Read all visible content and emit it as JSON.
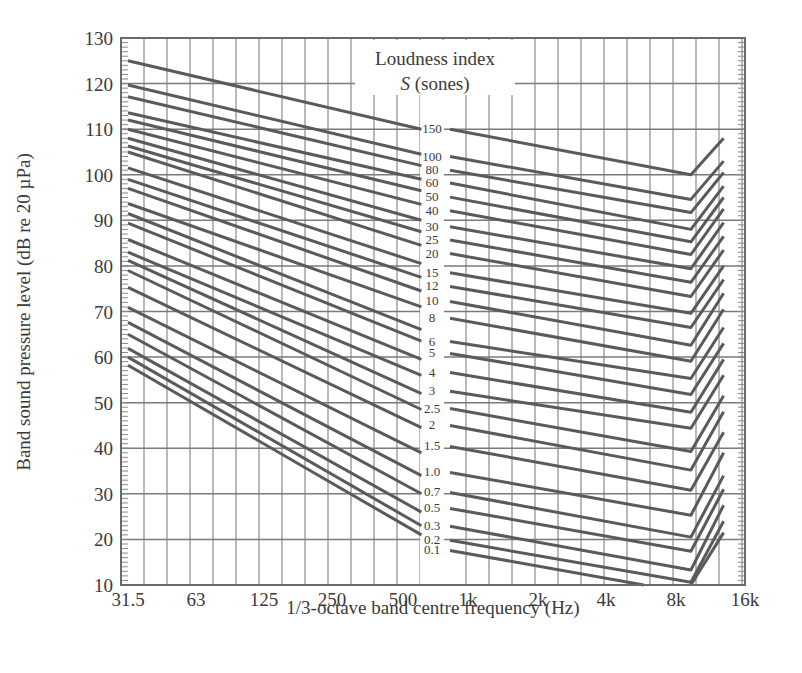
{
  "chart_data": {
    "type": "line",
    "title": "",
    "xlabel": "1/3-octave band centre frequency (Hz)",
    "ylabel": "Band sound pressure level (dB re 20 µPa)",
    "ylim": [
      10,
      130
    ],
    "yticks": [
      10,
      20,
      30,
      40,
      50,
      60,
      70,
      80,
      90,
      100,
      110,
      120,
      130
    ],
    "xticks": [
      "31.5",
      "63",
      "125",
      "250",
      "500",
      "1k",
      "2k",
      "4k",
      "8k",
      "16k"
    ],
    "x_scale": "log (1/3-octave bands)",
    "grid": true,
    "legend_title_line1": "Loudness index",
    "legend_title_line2_italic": "S",
    "legend_title_line2_rest": " (sones)",
    "annotation": "Equal-loudness-index contours; labels placed in a gap column between 500 Hz and 1 kHz",
    "series_points_description": "Each contour: [f_Hz, dB] points; left segment 31.5 Hz to ~600 Hz, right segment ~800 Hz to ~9 kHz kink then rising to 12.5 kHz",
    "series": [
      {
        "name": "150",
        "left": [
          [
            31.5,
            125
          ],
          [
            600,
            110
          ]
        ],
        "right": [
          [
            800,
            110
          ],
          [
            9000,
            100
          ],
          [
            12500,
            108
          ]
        ]
      },
      {
        "name": "100",
        "left": [
          [
            31.5,
            119.7
          ],
          [
            600,
            104.5
          ]
        ],
        "right": [
          [
            800,
            104
          ],
          [
            9000,
            94.6
          ],
          [
            12500,
            103
          ]
        ]
      },
      {
        "name": "80",
        "left": [
          [
            31.5,
            117.1
          ],
          [
            600,
            102
          ]
        ],
        "right": [
          [
            800,
            101
          ],
          [
            9000,
            91.7
          ],
          [
            12500,
            100.5
          ]
        ]
      },
      {
        "name": "60",
        "left": [
          [
            31.5,
            113.6
          ],
          [
            600,
            99
          ]
        ],
        "right": [
          [
            800,
            98.2
          ],
          [
            9000,
            88
          ],
          [
            12500,
            97.5
          ]
        ]
      },
      {
        "name": "50",
        "left": [
          [
            31.5,
            112
          ],
          [
            600,
            96.5
          ]
        ],
        "right": [
          [
            800,
            95.1
          ],
          [
            9000,
            85.3
          ],
          [
            12500,
            95
          ]
        ]
      },
      {
        "name": "40",
        "left": [
          [
            31.5,
            110
          ],
          [
            600,
            93.5
          ]
        ],
        "right": [
          [
            800,
            92.1
          ],
          [
            9000,
            82.5
          ],
          [
            12500,
            92.5
          ]
        ]
      },
      {
        "name": "30",
        "left": [
          [
            31.5,
            108
          ],
          [
            600,
            90
          ]
        ],
        "right": [
          [
            800,
            88.6
          ],
          [
            9000,
            79.4
          ],
          [
            12500,
            89.5
          ]
        ]
      },
      {
        "name": "25",
        "left": [
          [
            31.5,
            106.3
          ],
          [
            600,
            87.5
          ]
        ],
        "right": [
          [
            800,
            85.7
          ],
          [
            9000,
            76.4
          ],
          [
            12500,
            86.5
          ]
        ]
      },
      {
        "name": "20",
        "left": [
          [
            31.5,
            105
          ],
          [
            600,
            84.5
          ]
        ],
        "right": [
          [
            800,
            82.7
          ],
          [
            9000,
            73.3
          ],
          [
            12500,
            83.5
          ]
        ]
      },
      {
        "name": "15",
        "left": [
          [
            31.5,
            101.5
          ],
          [
            600,
            80.5
          ]
        ],
        "right": [
          [
            800,
            78.5
          ],
          [
            9000,
            69.6
          ],
          [
            12500,
            80
          ]
        ]
      },
      {
        "name": "12",
        "left": [
          [
            31.5,
            99
          ],
          [
            600,
            77.5
          ]
        ],
        "right": [
          [
            800,
            75.5
          ],
          [
            9000,
            66.5
          ],
          [
            12500,
            77
          ]
        ]
      },
      {
        "name": "10",
        "left": [
          [
            31.5,
            97
          ],
          [
            600,
            74.5
          ]
        ],
        "right": [
          [
            800,
            72.2
          ],
          [
            9000,
            62.6
          ],
          [
            12500,
            74
          ]
        ]
      },
      {
        "name": "8",
        "left": [
          [
            31.5,
            93.7
          ],
          [
            600,
            71
          ]
        ],
        "right": [
          [
            800,
            68.5
          ],
          [
            9000,
            59.1
          ],
          [
            12500,
            70.5
          ]
        ]
      },
      {
        "name": "6",
        "left": [
          [
            31.5,
            91.5
          ],
          [
            600,
            66
          ]
        ],
        "right": [
          [
            800,
            63.4
          ],
          [
            9000,
            55.3
          ],
          [
            12500,
            66.5
          ]
        ]
      },
      {
        "name": "5",
        "left": [
          [
            31.5,
            89.4
          ],
          [
            600,
            63.5
          ]
        ],
        "right": [
          [
            800,
            60.8
          ],
          [
            9000,
            51.8
          ],
          [
            12500,
            63
          ]
        ]
      },
      {
        "name": "4",
        "left": [
          [
            31.5,
            85.8
          ],
          [
            600,
            59.5
          ]
        ],
        "right": [
          [
            800,
            56.6
          ],
          [
            9000,
            47.9
          ],
          [
            12500,
            59.5
          ]
        ]
      },
      {
        "name": "3",
        "left": [
          [
            31.5,
            83
          ],
          [
            600,
            56
          ]
        ],
        "right": [
          [
            800,
            52.5
          ],
          [
            9000,
            44.4
          ],
          [
            12500,
            56
          ]
        ]
      },
      {
        "name": "2.5",
        "left": [
          [
            31.5,
            81.2
          ],
          [
            600,
            52
          ]
        ],
        "right": [
          [
            800,
            48.7
          ],
          [
            9000,
            39.3
          ],
          [
            12500,
            51.5
          ]
        ]
      },
      {
        "name": "2",
        "left": [
          [
            31.5,
            79
          ],
          [
            600,
            48.5
          ]
        ],
        "right": [
          [
            800,
            45
          ],
          [
            9000,
            35.2
          ],
          [
            12500,
            48
          ]
        ]
      },
      {
        "name": "1.5",
        "left": [
          [
            31.5,
            75.3
          ],
          [
            600,
            44.5
          ]
        ],
        "right": [
          [
            800,
            40.4
          ],
          [
            9000,
            30.8
          ],
          [
            12500,
            43.5
          ]
        ]
      },
      {
        "name": "1.0",
        "left": [
          [
            31.5,
            70.9
          ],
          [
            600,
            39
          ]
        ],
        "right": [
          [
            800,
            34.7
          ],
          [
            9000,
            25.3
          ],
          [
            12500,
            39
          ]
        ]
      },
      {
        "name": "0.7",
        "left": [
          [
            31.5,
            67.6
          ],
          [
            600,
            34
          ]
        ],
        "right": [
          [
            800,
            30.3
          ],
          [
            9000,
            20.5
          ],
          [
            12500,
            34
          ]
        ]
      },
      {
        "name": "0.5",
        "left": [
          [
            31.5,
            65
          ],
          [
            600,
            30
          ]
        ],
        "right": [
          [
            800,
            26.8
          ],
          [
            9000,
            17.4
          ],
          [
            12500,
            31
          ]
        ]
      },
      {
        "name": "0.3",
        "left": [
          [
            31.5,
            61.9
          ],
          [
            600,
            26
          ]
        ],
        "right": [
          [
            800,
            22.9
          ],
          [
            9000,
            13.3
          ],
          [
            12500,
            27.5
          ]
        ]
      },
      {
        "name": "0.2",
        "left": [
          [
            31.5,
            60
          ],
          [
            600,
            23
          ]
        ],
        "right": [
          [
            800,
            19.8
          ],
          [
            9000,
            10.6
          ],
          [
            12500,
            24
          ]
        ]
      },
      {
        "name": "0.1",
        "left": [
          [
            31.5,
            58.2
          ],
          [
            600,
            21
          ]
        ],
        "right": [
          [
            800,
            17.6
          ],
          [
            5600,
            10
          ]
        ],
        "right2": [
          [
            9000,
            10
          ],
          [
            12500,
            21.5
          ]
        ]
      }
    ]
  }
}
